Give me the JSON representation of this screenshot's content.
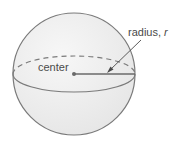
{
  "diagram": {
    "type": "sphere",
    "labels": {
      "center": "center",
      "radius_prefix": "radius, ",
      "radius_var": "r"
    },
    "colors": {
      "outline": "#7a7a7a",
      "fill": "#efefef",
      "radius_line": "#6a6a6a",
      "text": "#4a4a4a"
    }
  }
}
